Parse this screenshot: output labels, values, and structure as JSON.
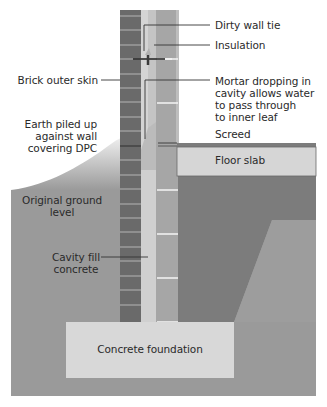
{
  "diagram": {
    "colors": {
      "background": "#ffffff",
      "ground": "#9a9a9a",
      "earth_pile_top": "#e4e4e4",
      "hardcore_fill": "#7a7a7a",
      "hardcore_light": "#9d9d9d",
      "brick": "#6a6a6a",
      "brick_joint": "#b8b8b8",
      "cavity": "#d2d2d2",
      "insulation": "#c2c2c2",
      "inner_leaf": "#a4a4a4",
      "inner_joint": "#f2f2f2",
      "screed": "#7c7c7c",
      "floor_slab": "#d6d6d6",
      "foundation": "#d8d8d8",
      "leader_line": "#333333"
    },
    "labels": {
      "dirty_wall_tie": "Dirty wall tie",
      "insulation": "Insulation",
      "brick_outer_skin": "Brick outer skin",
      "mortar_dropping": "Mortar dropping in\ncavity allows water\nto pass through\nto inner leaf",
      "earth_piled": "Earth piled up\nagainst wall\ncovering DPC",
      "screed": "Screed",
      "floor_slab": "Floor slab",
      "original_ground": "Original ground\nlevel",
      "cavity_fill": "Cavity fill\nconcrete",
      "concrete_foundation": "Concrete foundation"
    }
  }
}
